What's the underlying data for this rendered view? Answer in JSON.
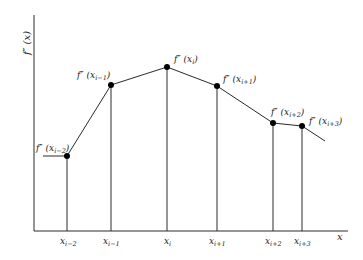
{
  "diagram": {
    "y_axis_label": "f″ (x)",
    "x_axis_label": "x",
    "line_color": "#2a2a2a",
    "point_color": "#000000",
    "background": "#ffffff",
    "points": [
      {
        "tick": "x",
        "tick_sub": "i−2",
        "value_label": "f″ (x",
        "value_sub": "i−2",
        "px": 67,
        "py": 156
      },
      {
        "tick": "x",
        "tick_sub": "i−1",
        "value_label": "f″ (x",
        "value_sub": "i−1",
        "px": 111,
        "py": 85
      },
      {
        "tick": "x",
        "tick_sub": "i",
        "value_label": "f″ (x",
        "value_sub": "i",
        "px": 167,
        "py": 67
      },
      {
        "tick": "x",
        "tick_sub": "i+1",
        "value_label": "f″ (x",
        "value_sub": "i+1",
        "px": 217,
        "py": 86
      },
      {
        "tick": "x",
        "tick_sub": "i+2",
        "value_label": "f″ (x",
        "value_sub": "i+2",
        "px": 273,
        "py": 123
      },
      {
        "tick": "x",
        "tick_sub": "i+3",
        "value_label": "f″ (x",
        "value_sub": "i+3",
        "px": 302,
        "py": 126
      }
    ],
    "close_paren": ")"
  }
}
